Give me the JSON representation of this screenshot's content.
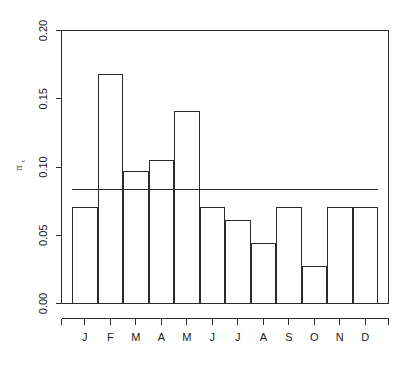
{
  "chart_data": {
    "type": "bar",
    "title": "",
    "subtitle": "",
    "xlabel": "",
    "ylabel": "π",
    "ylabel_subscript": "t",
    "categories": [
      "J",
      "F",
      "M",
      "A",
      "M",
      "J",
      "J",
      "A",
      "S",
      "O",
      "N",
      "D"
    ],
    "values": [
      0.07,
      0.168,
      0.097,
      0.105,
      0.141,
      0.07,
      0.061,
      0.044,
      0.07,
      0.027,
      0.07,
      0.07
    ],
    "ylim": [
      0.0,
      0.2
    ],
    "yticks": [
      0.0,
      0.05,
      0.1,
      0.15,
      0.2
    ],
    "ytick_labels": [
      "0.00",
      "0.05",
      "0.10",
      "0.15",
      "0.20"
    ],
    "grid": false,
    "legend": null,
    "annotations": [
      {
        "name": "reference-line",
        "type": "hline",
        "value": 0.0833,
        "label": ""
      }
    ],
    "bar_fill_color": "#ffffff",
    "bar_stroke_color": "#2b2b2b",
    "axis_color": "#2b2b2b",
    "background_color": "#ffffff"
  }
}
